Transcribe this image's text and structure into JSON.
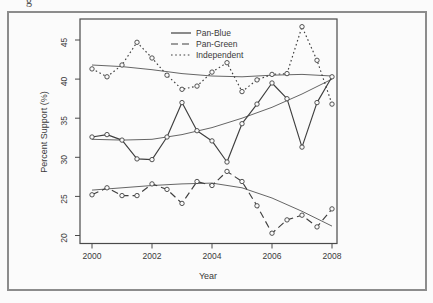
{
  "artifact": {
    "cropped_title_fragment": "g"
  },
  "figure": {
    "border_color": "#8c8c8c",
    "background_color": "#fbfbfb",
    "stroke_color": "#3f3f3f"
  },
  "chart_data": {
    "type": "line",
    "title": "",
    "xlabel": "Year",
    "ylabel": "Percent Support (%)",
    "x_ticks": [
      2000,
      2002,
      2004,
      2006,
      2008
    ],
    "y_ticks": [
      20,
      25,
      30,
      35,
      40,
      45
    ],
    "xlim": [
      1999.6,
      2008.2
    ],
    "ylim": [
      19.0,
      47.7
    ],
    "grid": false,
    "legend_position": "top-center",
    "marker": "open-circle",
    "x": [
      2000,
      2000.5,
      2001,
      2001.5,
      2002,
      2002.5,
      2003,
      2003.5,
      2004,
      2004.5,
      2005,
      2005.5,
      2006,
      2006.5,
      2007,
      2007.5,
      2008
    ],
    "series": [
      {
        "name": "Pan-Blue",
        "line_style": "solid",
        "values": [
          32.6,
          32.9,
          32.2,
          29.8,
          29.7,
          32.6,
          37.0,
          33.4,
          32.1,
          29.4,
          34.3,
          36.8,
          39.5,
          37.5,
          31.3,
          37.0,
          40.3
        ]
      },
      {
        "name": "Pan-Green",
        "line_style": "dashed",
        "values": [
          25.2,
          26.1,
          25.1,
          25.1,
          26.6,
          25.9,
          24.1,
          26.9,
          26.4,
          28.2,
          26.9,
          23.8,
          20.3,
          22.0,
          22.6,
          21.1,
          23.4
        ]
      },
      {
        "name": "Independent",
        "line_style": "dotted",
        "values": [
          41.3,
          40.3,
          41.8,
          44.7,
          42.7,
          40.5,
          38.7,
          39.1,
          40.9,
          42.1,
          38.4,
          39.9,
          40.6,
          40.7,
          46.7,
          42.4,
          36.8
        ]
      }
    ],
    "trend_lines": [
      {
        "for": "Pan-Blue",
        "x": [
          2000,
          2001,
          2002,
          2003,
          2004,
          2005,
          2006,
          2007,
          2008
        ],
        "values": [
          32.3,
          32.2,
          32.3,
          32.9,
          33.8,
          35.0,
          36.4,
          38.1,
          40.0
        ]
      },
      {
        "for": "Pan-Green",
        "x": [
          2000,
          2001,
          2002,
          2003,
          2004,
          2005,
          2006,
          2007,
          2008
        ],
        "values": [
          25.8,
          26.1,
          26.4,
          26.6,
          26.7,
          26.1,
          24.8,
          23.1,
          21.2
        ]
      },
      {
        "for": "Independent",
        "x": [
          2000,
          2001,
          2002,
          2003,
          2004,
          2005,
          2006,
          2007,
          2008
        ],
        "values": [
          41.8,
          41.6,
          41.2,
          40.7,
          40.4,
          40.3,
          40.5,
          40.6,
          40.4
        ]
      }
    ]
  }
}
